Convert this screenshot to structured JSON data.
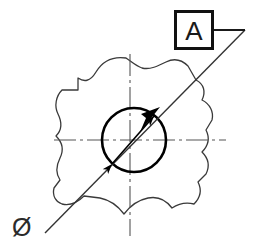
{
  "drawing": {
    "title": "Engineering drawing detail view",
    "background_color": "#ffffff",
    "width": 254,
    "height": 252,
    "line_color": "#333333",
    "heavy_line_color": "#000000",
    "centerline_color": "#555555"
  },
  "datum_callout": {
    "label": "A",
    "box": {
      "x": 174,
      "y": 10,
      "width": 40,
      "height": 40,
      "border_width": 3,
      "border_color": "#111111"
    },
    "tail": {
      "from_x": 214,
      "from_y": 30,
      "to_x": 245,
      "to_y": 30
    }
  },
  "diameter_note": {
    "symbol": "Ø",
    "x": 12,
    "y": 236
  },
  "leader_line": {
    "name": "datum-leader-line",
    "from_x": 45,
    "from_y": 233,
    "to_x": 245,
    "to_y": 30,
    "arrow_tip_x": 158,
    "arrow_tip_y": 109
  },
  "feature_circle": {
    "center_x": 134,
    "center_y": 140,
    "radius": 32,
    "stroke_width": 2.6
  },
  "dimension_arrow": {
    "start_x": 108,
    "start_y": 168,
    "end_x": 158,
    "end_y": 112,
    "double_headed": true
  },
  "centerlines": {
    "horizontal": {
      "x1": 54,
      "y1": 140,
      "x2": 226,
      "y2": 140
    },
    "vertical": {
      "x1": 130,
      "y1": 54,
      "x2": 130,
      "y2": 236
    },
    "dash_pattern": "22 4 3 4"
  },
  "break_outline": {
    "name": "wavy-break-boundary",
    "stroke_width": 1.3,
    "description": "irregular freehand closed break line enclosing the feature"
  }
}
